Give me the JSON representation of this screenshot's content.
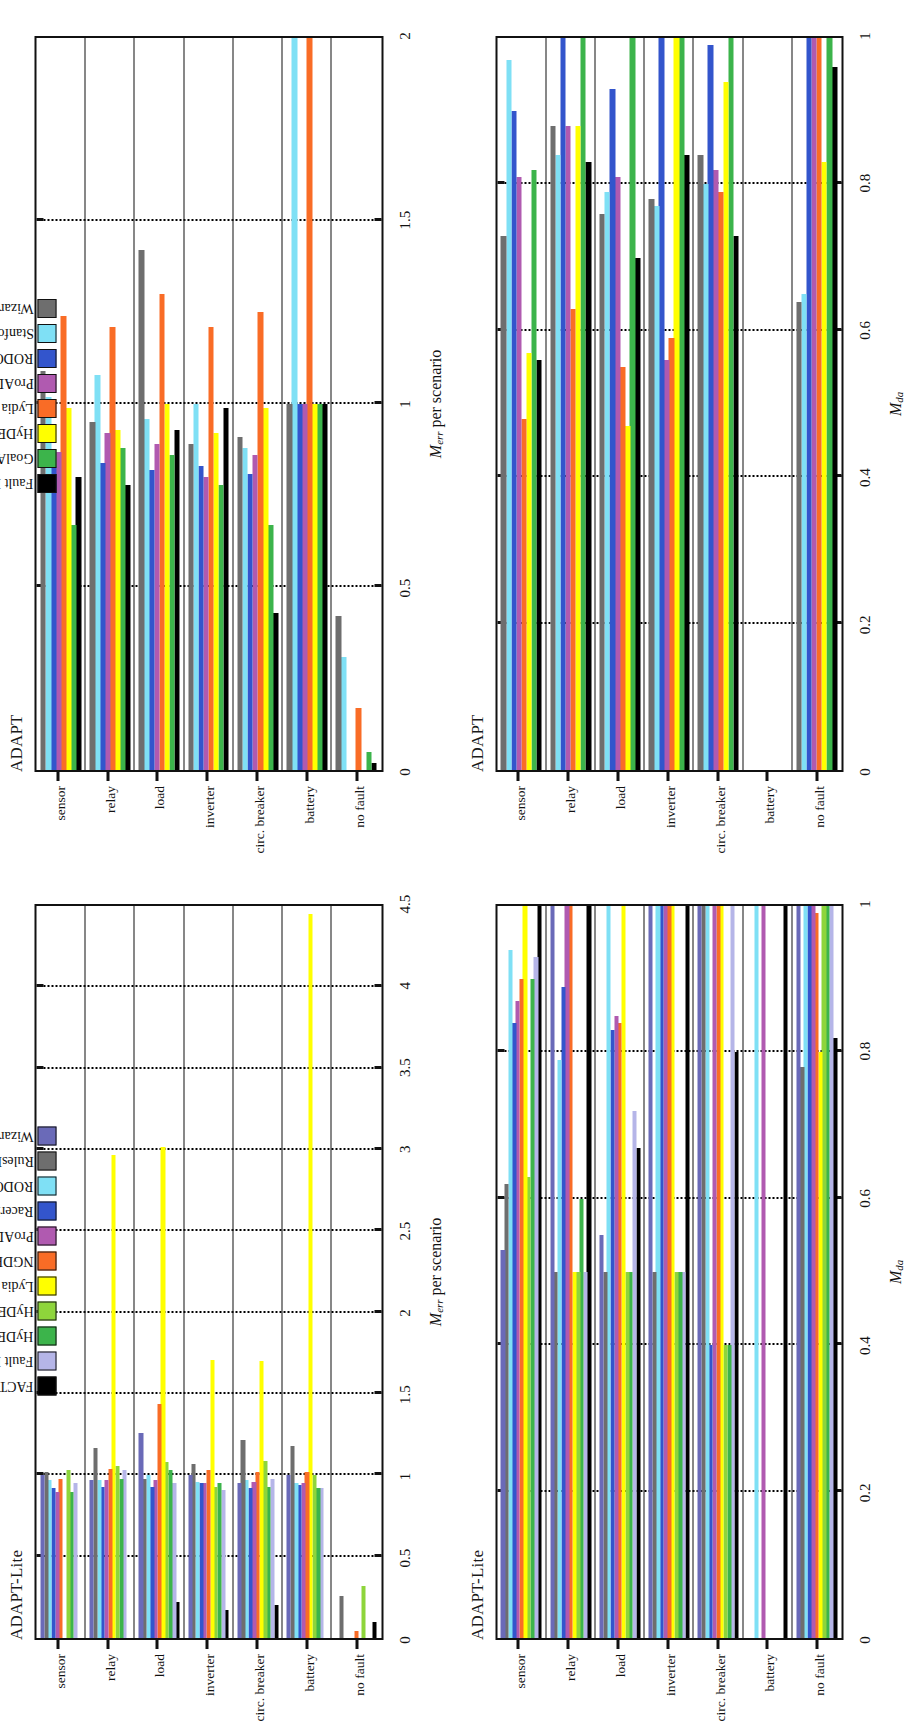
{
  "figure": {
    "rotation_deg": -90,
    "panels": 4
  },
  "legends": {
    "adapt_lite": {
      "labels": [
        "FACT",
        "Fault Buster",
        "HyDE",
        "HyDE-S",
        "Lydia",
        "NGDE",
        "ProADAPT",
        "RacerX",
        "RODON",
        "RulesRule",
        "Wizards of Oz"
      ],
      "colors": [
        "#000000",
        "#b5b5e8",
        "#3cb44b",
        "#8ed53b",
        "#ffff00",
        "#f96c26",
        "#b05ab0",
        "#3355cc",
        "#7fe0f5",
        "#6e6e6e",
        "#6a6ab8"
      ]
    },
    "adapt": {
      "labels": [
        "Fault Buster",
        "GoalArt",
        "HyDE",
        "Lydia",
        "ProADAPT",
        "RODON",
        "StanfordDA",
        "Wizards of Oz"
      ],
      "colors": [
        "#000000",
        "#3cb44b",
        "#ffff00",
        "#f96c26",
        "#b05ab0",
        "#3355cc",
        "#7fe0f5",
        "#6e6e6e"
      ]
    }
  },
  "chart_data": [
    {
      "id": "adapt-lite-merr",
      "type": "bar",
      "orientation": "horizontal",
      "title": "ADAPT-Lite",
      "ylabel": "M_err per scenario",
      "xlabel": "",
      "ylim": [
        0,
        4.5
      ],
      "yticks": [
        "0",
        "0.5",
        "1",
        "1.5",
        "2",
        "2.5",
        "3",
        "3.5",
        "4",
        "4.5"
      ],
      "ytick_values": [
        0,
        0.5,
        1,
        1.5,
        2,
        2.5,
        3,
        3.5,
        4,
        4.5
      ],
      "grid": true,
      "categories": [
        "no fault",
        "battery",
        "circ. breaker",
        "inverter",
        "load",
        "relay",
        "sensor"
      ],
      "legend": "adapt_lite",
      "series": [
        {
          "name": "FACT",
          "color": "#000000",
          "values": [
            0.1,
            0.0,
            0.2,
            0.17,
            0.22,
            0.0,
            0.0
          ]
        },
        {
          "name": "Fault Buster",
          "color": "#b5b5e8",
          "values": [
            0.0,
            0.92,
            0.98,
            0.91,
            0.95,
            1.03,
            0.95
          ]
        },
        {
          "name": "HyDE",
          "color": "#3cb44b",
          "values": [
            0.0,
            0.92,
            0.93,
            0.95,
            1.03,
            0.98,
            0.9
          ]
        },
        {
          "name": "HyDE-S",
          "color": "#8ed53b",
          "values": [
            0.32,
            1.0,
            1.09,
            0.93,
            1.08,
            1.06,
            1.03
          ]
        },
        {
          "name": "Lydia",
          "color": "#ffff00",
          "values": [
            0.0,
            4.45,
            1.7,
            1.71,
            3.02,
            2.97,
            0.0
          ]
        },
        {
          "name": "NGDE",
          "color": "#f96c26",
          "values": [
            0.04,
            1.02,
            1.02,
            1.03,
            1.44,
            1.04,
            0.98
          ]
        },
        {
          "name": "ProADAPT",
          "color": "#b05ab0",
          "values": [
            0.0,
            0.95,
            0.96,
            0.95,
            0.97,
            0.97,
            0.9
          ]
        },
        {
          "name": "RacerX",
          "color": "#3355cc",
          "values": [
            0.0,
            0.94,
            0.92,
            0.95,
            0.93,
            0.93,
            0.92
          ]
        },
        {
          "name": "RODON",
          "color": "#7fe0f5",
          "values": [
            0.0,
            0.95,
            0.97,
            0.96,
            1.0,
            0.97,
            0.97
          ]
        },
        {
          "name": "RulesRule",
          "color": "#6e6e6e",
          "values": [
            0.26,
            1.18,
            1.22,
            1.07,
            0.98,
            1.17,
            1.02
          ]
        },
        {
          "name": "Wizards of Oz",
          "color": "#6a6ab8",
          "values": [
            0.0,
            1.0,
            0.95,
            1.0,
            1.26,
            0.97,
            1.0
          ]
        }
      ]
    },
    {
      "id": "adapt-merr",
      "type": "bar",
      "orientation": "horizontal",
      "title": "ADAPT",
      "ylabel": "M_err per scenario",
      "xlabel": "",
      "ylim": [
        0,
        2.0
      ],
      "yticks": [
        "0",
        "0.5",
        "1",
        "1.5",
        "2"
      ],
      "ytick_values": [
        0,
        0.5,
        1,
        1.5,
        2
      ],
      "grid": true,
      "categories": [
        "no fault",
        "battery",
        "circ. breaker",
        "inverter",
        "load",
        "relay",
        "sensor"
      ],
      "legend": "adapt",
      "series": [
        {
          "name": "Fault Buster",
          "color": "#000000",
          "values": [
            0.02,
            1.0,
            0.43,
            0.99,
            0.93,
            0.78,
            0.8
          ]
        },
        {
          "name": "GoalArt",
          "color": "#3cb44b",
          "values": [
            0.05,
            1.0,
            0.67,
            0.78,
            0.86,
            0.88,
            0.67
          ]
        },
        {
          "name": "HyDE",
          "color": "#ffff00",
          "values": [
            0.0,
            1.0,
            0.99,
            0.92,
            1.0,
            0.93,
            0.99
          ]
        },
        {
          "name": "Lydia",
          "color": "#f96c26",
          "values": [
            0.17,
            2.0,
            1.25,
            1.21,
            1.3,
            1.21,
            1.24
          ]
        },
        {
          "name": "ProADAPT",
          "color": "#b05ab0",
          "values": [
            0.0,
            1.0,
            0.86,
            0.8,
            0.89,
            0.92,
            0.87
          ]
        },
        {
          "name": "RODON",
          "color": "#3355cc",
          "values": [
            0.0,
            1.0,
            0.81,
            0.83,
            0.82,
            0.84,
            0.83
          ]
        },
        {
          "name": "StanfordDA",
          "color": "#7fe0f5",
          "values": [
            0.31,
            2.0,
            0.88,
            1.0,
            0.96,
            1.08,
            1.02
          ]
        },
        {
          "name": "Wizards of Oz",
          "color": "#6e6e6e",
          "values": [
            0.42,
            1.0,
            0.91,
            0.89,
            1.42,
            0.95,
            1.09
          ]
        }
      ]
    },
    {
      "id": "adapt-lite-mda",
      "type": "bar",
      "orientation": "horizontal",
      "title": "ADAPT-Lite",
      "ylabel": "M_da",
      "xlabel": "",
      "ylim": [
        0,
        1.0
      ],
      "yticks": [
        "0",
        "0.2",
        "0.4",
        "0.6",
        "0.8",
        "1"
      ],
      "ytick_values": [
        0,
        0.2,
        0.4,
        0.6,
        0.8,
        1
      ],
      "grid": true,
      "categories": [
        "no fault",
        "battery",
        "circ. breaker",
        "inverter",
        "load",
        "relay",
        "sensor"
      ],
      "legend": "adapt_lite",
      "series": [
        {
          "name": "FACT",
          "color": "#000000",
          "values": [
            0.82,
            1.0,
            0.8,
            1.0,
            0.67,
            1.0,
            1.0
          ]
        },
        {
          "name": "Fault Buster",
          "color": "#b5b5e8",
          "values": [
            1.0,
            0.0,
            1.0,
            0.5,
            0.72,
            0.5,
            0.93
          ]
        },
        {
          "name": "HyDE",
          "color": "#3cb44b",
          "values": [
            1.0,
            0.0,
            0.4,
            0.5,
            0.5,
            0.6,
            0.9
          ]
        },
        {
          "name": "HyDE-S",
          "color": "#8ed53b",
          "values": [
            1.0,
            0.0,
            0.4,
            0.5,
            0.5,
            0.5,
            0.63
          ]
        },
        {
          "name": "Lydia",
          "color": "#ffff00",
          "values": [
            0.8,
            0.0,
            1.0,
            1.0,
            1.0,
            0.5,
            1.0
          ]
        },
        {
          "name": "NGDE",
          "color": "#f96c26",
          "values": [
            0.99,
            0.0,
            1.0,
            1.0,
            0.84,
            1.0,
            0.9
          ]
        },
        {
          "name": "ProADAPT",
          "color": "#b05ab0",
          "values": [
            1.0,
            1.0,
            1.0,
            1.0,
            0.85,
            1.0,
            0.87
          ]
        },
        {
          "name": "RacerX",
          "color": "#3355cc",
          "values": [
            1.0,
            0.0,
            0.4,
            1.0,
            0.83,
            0.89,
            0.84
          ]
        },
        {
          "name": "RODON",
          "color": "#7fe0f5",
          "values": [
            1.0,
            1.0,
            1.0,
            1.0,
            1.0,
            0.79,
            0.94
          ]
        },
        {
          "name": "RulesRule",
          "color": "#6e6e6e",
          "values": [
            0.78,
            0.0,
            1.0,
            0.5,
            0.5,
            0.5,
            0.62
          ]
        },
        {
          "name": "Wizards of Oz",
          "color": "#6a6ab8",
          "values": [
            1.0,
            0.0,
            1.0,
            1.0,
            0.55,
            1.0,
            0.53
          ]
        }
      ]
    },
    {
      "id": "adapt-mda",
      "type": "bar",
      "orientation": "horizontal",
      "title": "ADAPT",
      "ylabel": "M_da",
      "xlabel": "",
      "ylim": [
        0,
        1.0
      ],
      "yticks": [
        "0",
        "0.2",
        "0.4",
        "0.6",
        "0.8",
        "1"
      ],
      "ytick_values": [
        0,
        0.2,
        0.4,
        0.6,
        0.8,
        1
      ],
      "grid": true,
      "categories": [
        "no fault",
        "battery",
        "circ. breaker",
        "inverter",
        "load",
        "relay",
        "sensor"
      ],
      "legend": "adapt",
      "series": [
        {
          "name": "Fault Buster",
          "color": "#000000",
          "values": [
            0.96,
            0.0,
            0.73,
            0.84,
            0.7,
            0.83,
            0.56
          ]
        },
        {
          "name": "GoalArt",
          "color": "#3cb44b",
          "values": [
            1.0,
            0.0,
            1.0,
            1.0,
            1.0,
            1.0,
            0.82
          ]
        },
        {
          "name": "HyDE",
          "color": "#ffff00",
          "values": [
            0.83,
            0.0,
            0.94,
            1.0,
            0.47,
            0.88,
            0.57
          ]
        },
        {
          "name": "Lydia",
          "color": "#f96c26",
          "values": [
            1.0,
            0.0,
            0.79,
            0.59,
            0.55,
            0.63,
            0.48
          ]
        },
        {
          "name": "ProADAPT",
          "color": "#b05ab0",
          "values": [
            1.0,
            0.0,
            0.82,
            0.56,
            0.81,
            0.88,
            0.81
          ]
        },
        {
          "name": "RODON",
          "color": "#3355cc",
          "values": [
            1.0,
            0.0,
            0.99,
            1.0,
            0.93,
            1.0,
            0.9
          ]
        },
        {
          "name": "StanfordDA",
          "color": "#7fe0f5",
          "values": [
            0.65,
            0.0,
            0.8,
            0.77,
            0.79,
            0.84,
            0.97
          ]
        },
        {
          "name": "Wizards of Oz",
          "color": "#6e6e6e",
          "values": [
            0.64,
            0.0,
            0.84,
            0.78,
            0.76,
            0.88,
            0.73
          ]
        }
      ]
    }
  ]
}
